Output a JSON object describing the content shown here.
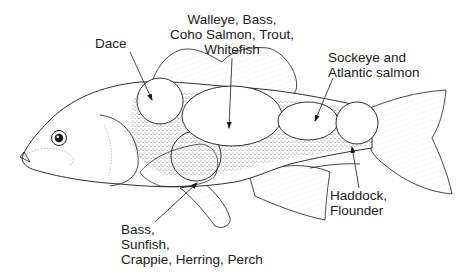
{
  "diagram": {
    "subject": "fish",
    "labels": {
      "dace": {
        "lines": [
          "Dace"
        ]
      },
      "walleye": {
        "lines": [
          "Walleye, Bass,",
          "Coho Salmon, Trout,",
          "Whitefish"
        ]
      },
      "sockeye": {
        "lines": [
          "Sockeye and",
          "Atlantic salmon"
        ]
      },
      "haddock": {
        "lines": [
          "Haddock,",
          "Flounder"
        ]
      },
      "bass": {
        "lines": [
          "Bass,",
          "Sunfish,",
          "Crappie, Herring, Perch"
        ]
      }
    },
    "colors": {
      "ink": "#1a1a1a",
      "background": "#ffffff",
      "stipple": "#555555"
    }
  }
}
